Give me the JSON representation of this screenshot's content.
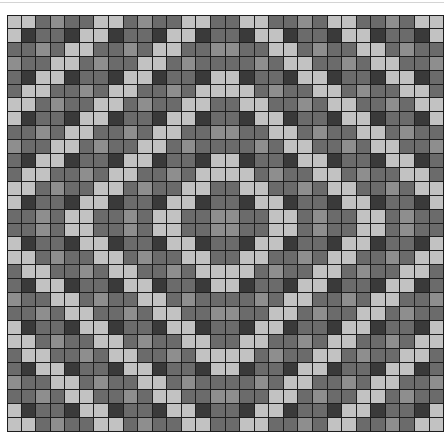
{
  "pattern": {
    "rows": 30,
    "cols": 30,
    "cell_width": 14.57,
    "cell_height": 13.9,
    "symmetry": "mirror-both-axes",
    "tile": [
      [
        "L",
        "L",
        "D",
        "M",
        "D",
        "D"
      ],
      [
        "L",
        "K",
        "D",
        "D",
        "K",
        "L"
      ],
      [
        "D",
        "D",
        "M",
        "D",
        "L",
        "L"
      ],
      [
        "M",
        "D",
        "D",
        "L",
        "L",
        "D"
      ],
      [
        "D",
        "K",
        "L",
        "L",
        "K",
        "D"
      ],
      [
        "D",
        "L",
        "L",
        "D",
        "D",
        "M"
      ]
    ],
    "shades": {
      "L": "#c2c2c2",
      "M": "#8e8e8e",
      "D": "#6b6b6b",
      "K": "#3a3a3a"
    },
    "grid_line_color": "#1e1e1e"
  }
}
